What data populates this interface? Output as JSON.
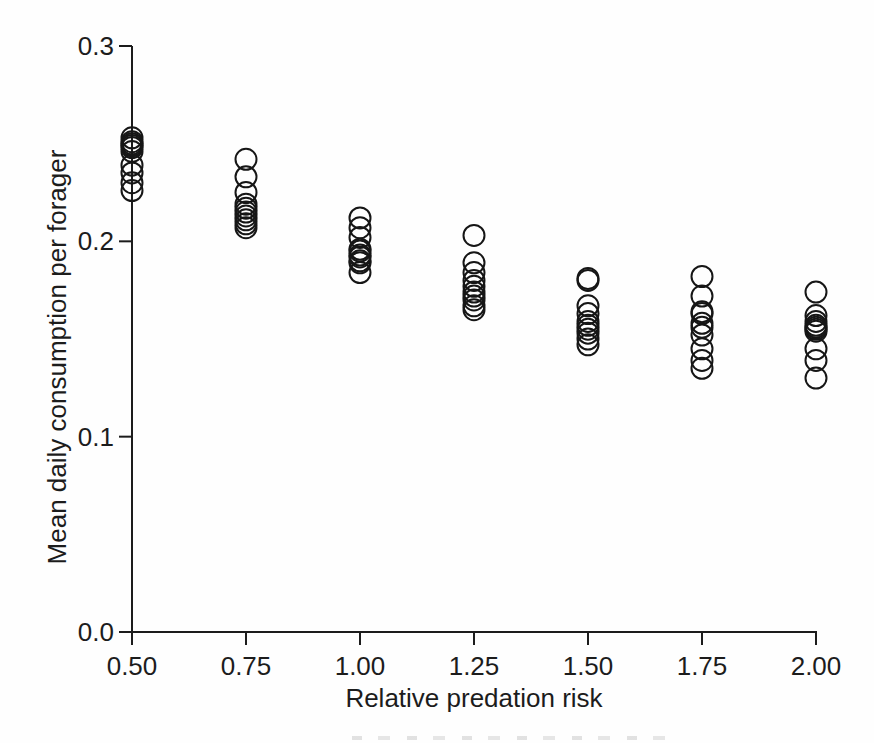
{
  "chart_data": {
    "type": "scatter",
    "title": "",
    "xlabel": "Relative predation risk",
    "ylabel": "Mean daily consumption per forager",
    "xlim": [
      0.5,
      2.0
    ],
    "ylim": [
      0.0,
      0.3
    ],
    "grid": false,
    "legend": null,
    "marker": "open-circle",
    "marker_color": "#161616",
    "x_ticks": {
      "values": [
        0.5,
        0.75,
        1.0,
        1.25,
        1.5,
        1.75,
        2.0
      ],
      "labels": [
        "0.50",
        "0.75",
        "1.00",
        "1.25",
        "1.50",
        "1.75",
        "2.00"
      ]
    },
    "y_ticks": {
      "values": [
        0.3,
        0.2,
        0.1,
        0.0
      ],
      "labels": [
        "0.3",
        "0.2",
        "0.1",
        "0.0"
      ]
    },
    "groups": [
      {
        "x": 0.5,
        "values": [
          0.253,
          0.251,
          0.25,
          0.249,
          0.248,
          0.246,
          0.239,
          0.235,
          0.23,
          0.226
        ]
      },
      {
        "x": 0.75,
        "values": [
          0.242,
          0.233,
          0.225,
          0.219,
          0.217,
          0.215,
          0.213,
          0.211,
          0.209,
          0.207
        ]
      },
      {
        "x": 1.0,
        "values": [
          0.212,
          0.207,
          0.202,
          0.196,
          0.195,
          0.193,
          0.192,
          0.19,
          0.189,
          0.184
        ]
      },
      {
        "x": 1.25,
        "values": [
          0.203,
          0.189,
          0.184,
          0.18,
          0.177,
          0.174,
          0.172,
          0.17,
          0.167,
          0.165
        ]
      },
      {
        "x": 1.5,
        "values": [
          0.181,
          0.18,
          0.167,
          0.163,
          0.159,
          0.157,
          0.155,
          0.153,
          0.15,
          0.147
        ]
      },
      {
        "x": 1.75,
        "values": [
          0.182,
          0.172,
          0.164,
          0.163,
          0.158,
          0.156,
          0.152,
          0.145,
          0.139,
          0.135
        ]
      },
      {
        "x": 2.0,
        "values": [
          0.174,
          0.162,
          0.159,
          0.157,
          0.156,
          0.155,
          0.154,
          0.145,
          0.139,
          0.13
        ]
      }
    ]
  }
}
